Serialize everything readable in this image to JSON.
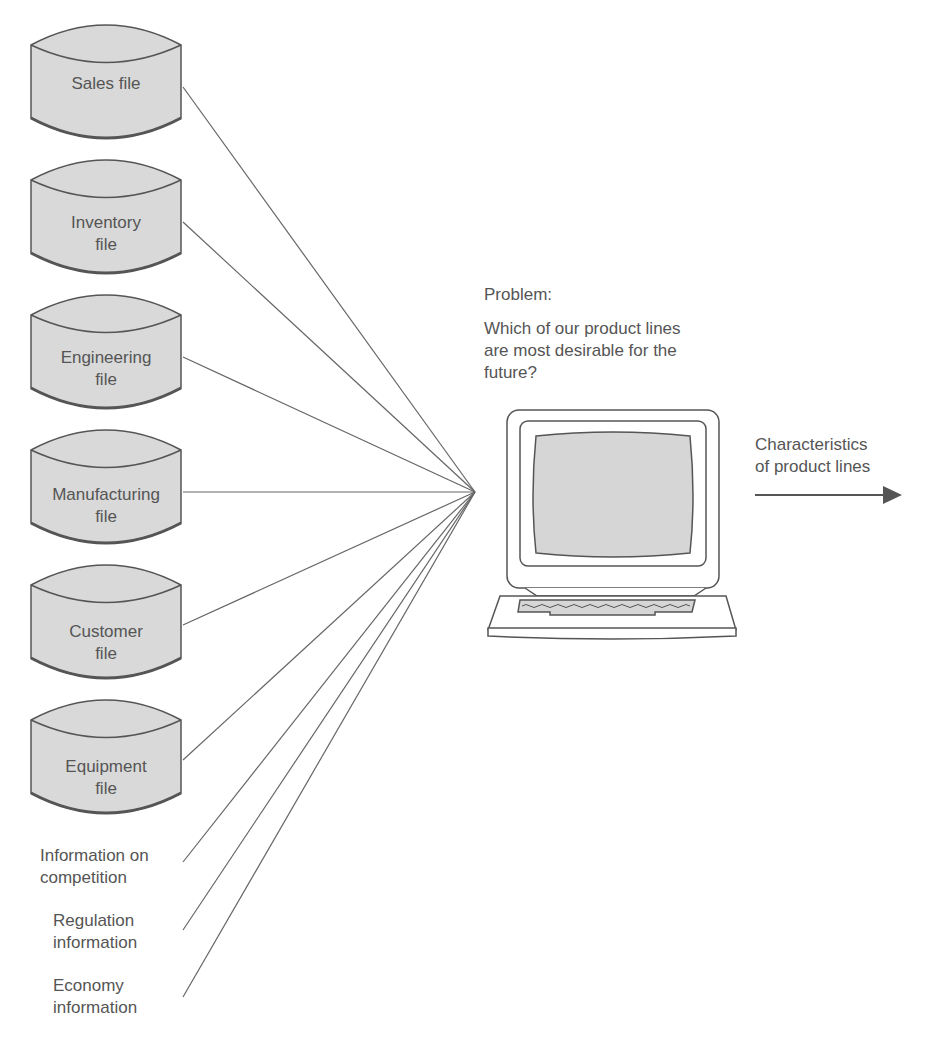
{
  "diagram": {
    "data_sources": [
      {
        "label_line1": "Sales file",
        "label_line2": ""
      },
      {
        "label_line1": "Inventory",
        "label_line2": "file"
      },
      {
        "label_line1": "Engineering",
        "label_line2": "file"
      },
      {
        "label_line1": "Manufacturing",
        "label_line2": "file"
      },
      {
        "label_line1": "Customer",
        "label_line2": "file"
      },
      {
        "label_line1": "Equipment",
        "label_line2": "file"
      }
    ],
    "external_sources": [
      {
        "line1": "Information on",
        "line2": "competition"
      },
      {
        "line1": "Regulation",
        "line2": "information"
      },
      {
        "line1": "Economy",
        "line2": "information"
      }
    ],
    "problem": {
      "heading": "Problem:",
      "line1": "Which of our product lines",
      "line2": "are most desirable for the",
      "line3": "future?"
    },
    "output": {
      "line1": "Characteristics",
      "line2": "of product lines"
    },
    "colors": {
      "cylinder_fill": "#d9d9d9",
      "stroke": "#555555",
      "screen_fill": "#d6d6d6"
    }
  }
}
